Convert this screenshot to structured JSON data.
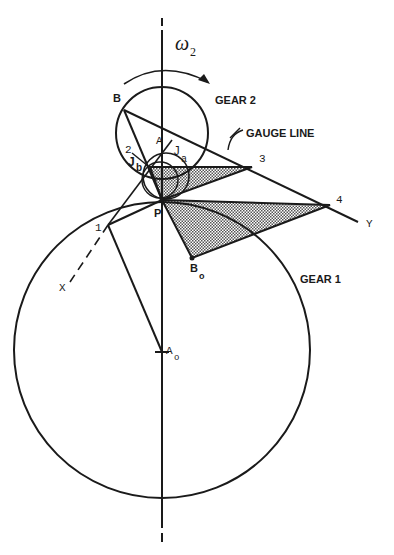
{
  "figure": {
    "type": "gear kinematics diagram",
    "labels": {
      "omega": "ω",
      "omega_sub": "2",
      "gear2": "GEAR 2",
      "gear1": "GEAR 1",
      "gauge_line": "GAUGE LINE",
      "B": "B",
      "A": "A",
      "P": "P",
      "pt1": "1",
      "pt2": "2",
      "pt3": "3",
      "pt4": "4",
      "X": "X",
      "Y": "Y",
      "Ja": "J",
      "Ja_sub": "a",
      "Jb": "J",
      "Jb_sub": "b",
      "Bo": "B",
      "Bo_sub": "o",
      "Ao": "A",
      "Ao_sub": "o"
    },
    "colors": {
      "ink": "#1a1a1a",
      "shade": "#9a9a9a",
      "background": "#ffffff"
    }
  }
}
